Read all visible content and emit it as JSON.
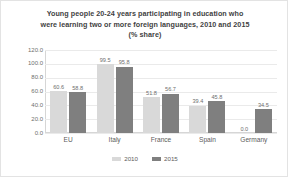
{
  "chart_data": {
    "type": "bar",
    "title": "Young people 20-24 years participating in education who were learning two or more foreign languages, 2010 and 2015 (% share)",
    "title_lines": [
      "Young people 20-24 years participating in education who",
      "were learning two or more foreign languages, 2010 and 2015",
      "(% share)"
    ],
    "categories": [
      "EU",
      "Italy",
      "France",
      "Spain",
      "Germany"
    ],
    "series": [
      {
        "name": "2010",
        "color": "#d9d9d9",
        "values": [
          60.6,
          99.5,
          51.8,
          39.4,
          0.0
        ]
      },
      {
        "name": "2015",
        "color": "#7f7f7f",
        "values": [
          58.8,
          95.8,
          56.7,
          45.8,
          34.5
        ]
      }
    ],
    "value_labels": {
      "2010": [
        "60.6",
        "99.5",
        "51.8",
        "39.4",
        "0.0"
      ],
      "2015": [
        "58.8",
        "95.8",
        "56.7",
        "45.8",
        "34.5"
      ]
    },
    "xlabel": "",
    "ylabel": "",
    "ylim": [
      0,
      120
    ],
    "ytick_values": [
      120.0,
      100.0,
      80.0,
      60.0,
      40.0,
      20.0,
      0.0
    ],
    "ytick_labels": [
      "120.0",
      "100.0",
      "80.0",
      "60.0",
      "40.0",
      "20.0",
      "0.0"
    ],
    "grid": true,
    "legend_position": "bottom",
    "legend_entries": [
      "2010",
      "2015"
    ]
  }
}
